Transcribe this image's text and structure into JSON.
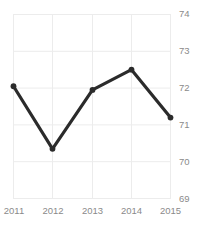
{
  "chart_data": {
    "type": "line",
    "title": "Freedom Trend",
    "xlabel": "",
    "ylabel": "",
    "categories": [
      "2011",
      "2012",
      "2013",
      "2014",
      "2015"
    ],
    "values": [
      72.05,
      70.35,
      71.95,
      72.5,
      71.2
    ],
    "series": [
      {
        "name": "Freedom Trend",
        "values": [
          72.05,
          70.35,
          71.95,
          72.5,
          71.2
        ]
      }
    ],
    "x": [
      2011,
      2012,
      2013,
      2014,
      2015
    ],
    "ylim": [
      69,
      74
    ],
    "xlim": [
      2011,
      2015
    ],
    "yticks": [
      74,
      73,
      72,
      71,
      70,
      69
    ],
    "xticks": [
      "2011",
      "2012",
      "2013",
      "2014",
      "2015"
    ],
    "grid": true,
    "y_axis_position": "right",
    "legend": false,
    "legend_position": "none",
    "markers": true,
    "line_color": "#2b2b2b",
    "grid_color": "#ececec",
    "tick_label_color": "#8a8a8a",
    "background_color": "#ffffff",
    "annotations": []
  },
  "axes": {
    "y_ticks": [
      {
        "label": "74",
        "value": 74
      },
      {
        "label": "73",
        "value": 73
      },
      {
        "label": "72",
        "value": 72
      },
      {
        "label": "71",
        "value": 71
      },
      {
        "label": "70",
        "value": 70
      },
      {
        "label": "69",
        "value": 69
      }
    ],
    "x_ticks": [
      {
        "label": "2011",
        "value": 2011
      },
      {
        "label": "2012",
        "value": 2012
      },
      {
        "label": "2013",
        "value": 2013
      },
      {
        "label": "2014",
        "value": 2014
      },
      {
        "label": "2015",
        "value": 2015
      }
    ]
  }
}
